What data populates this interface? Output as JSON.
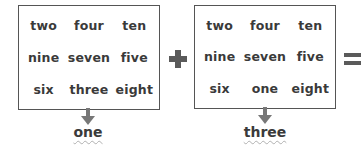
{
  "puzzle": {
    "box1": {
      "rows": [
        [
          "two",
          "four",
          "ten"
        ],
        [
          "nine",
          "seven",
          "five"
        ],
        [
          "six",
          "three",
          "eight"
        ]
      ],
      "output": "one"
    },
    "operator_1": "plus",
    "box2": {
      "rows": [
        [
          "two",
          "four",
          "ten"
        ],
        [
          "nine",
          "seven",
          "five"
        ],
        [
          "six",
          "one",
          "eight"
        ]
      ],
      "output": "three"
    },
    "operator_2": "equals",
    "colors": {
      "text": "#3a3a3a",
      "border": "#555555",
      "arrow": "#777777",
      "operator": "#5a5a5a",
      "wavy_underline": "#b0b0b0"
    }
  }
}
